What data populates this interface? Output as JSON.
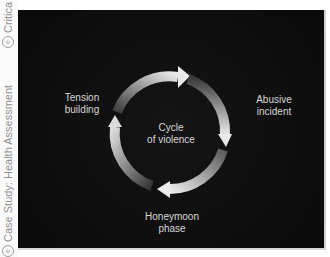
{
  "sidebar": {
    "items": [
      {
        "icon": "e-circle-icon",
        "label": "Case Study: Health Assessment"
      },
      {
        "icon": "e-circle-icon",
        "label": "Critica"
      }
    ]
  },
  "diagram": {
    "title": "Cycle of violence",
    "center_label_line1": "Cycle",
    "center_label_line2": "of violence",
    "stages": [
      {
        "line1": "Tension",
        "line2": "building"
      },
      {
        "line1": "Abusive",
        "line2": "incident"
      },
      {
        "line1": "Honeymoon",
        "line2": "phase"
      }
    ],
    "colors": {
      "background": "#0d0d0d",
      "arrow_light": "#e6e6e6",
      "arrow_dark": "#3a3a3a",
      "text": "#d8d8d8"
    }
  }
}
